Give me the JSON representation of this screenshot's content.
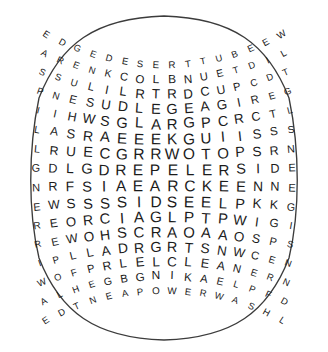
{
  "puzzle": {
    "kind": "word-search-grid",
    "shape": "barrel-distorted-rounded-square",
    "rows": 16,
    "cols": 16,
    "ink_color": "#1b1b1b",
    "background_color": "#ffffff",
    "border_color": "#3c3c3c",
    "grid": [
      [
        "E",
        "D",
        "G",
        "E",
        "D",
        "E",
        "S",
        "E",
        "R",
        "T",
        "T",
        "U",
        "B",
        "E",
        "E",
        "W"
      ],
      [
        "A",
        "R",
        "E",
        "N",
        "K",
        "C",
        "O",
        "L",
        "B",
        "N",
        "U",
        "E",
        "T",
        "D",
        "I",
        "L"
      ],
      [
        "S",
        "S",
        "U",
        "L",
        "I",
        "L",
        "R",
        "T",
        "R",
        "D",
        "C",
        "U",
        "P",
        "C",
        "D",
        "T"
      ],
      [
        "P",
        "N",
        "E",
        "S",
        "U",
        "D",
        "L",
        "E",
        "G",
        "E",
        "A",
        "G",
        "I",
        "R",
        "E",
        "G"
      ],
      [
        "I",
        "I",
        "H",
        "W",
        "S",
        "G",
        "L",
        "A",
        "R",
        "G",
        "P",
        "C",
        "R",
        "C",
        "T",
        "L"
      ],
      [
        "L",
        "A",
        "S",
        "R",
        "A",
        "E",
        "E",
        "E",
        "K",
        "G",
        "U",
        "I",
        "I",
        "S",
        "S",
        "S"
      ],
      [
        "L",
        "R",
        "U",
        "E",
        "C",
        "G",
        "R",
        "R",
        "W",
        "O",
        "T",
        "O",
        "P",
        "S",
        "R",
        "N"
      ],
      [
        "G",
        "D",
        "L",
        "G",
        "D",
        "R",
        "E",
        "P",
        "E",
        "L",
        "E",
        "R",
        "S",
        "I",
        "D",
        "E"
      ],
      [
        "N",
        "R",
        "F",
        "S",
        "I",
        "A",
        "E",
        "A",
        "R",
        "C",
        "K",
        "E",
        "E",
        "N",
        "N",
        "E"
      ],
      [
        "E",
        "W",
        "S",
        "S",
        "S",
        "S",
        "I",
        "D",
        "S",
        "E",
        "E",
        "L",
        "P",
        "K",
        "K",
        "G"
      ],
      [
        "R",
        "E",
        "O",
        "R",
        "C",
        "I",
        "A",
        "G",
        "L",
        "P",
        "T",
        "P",
        "W",
        "I",
        "G",
        "I"
      ],
      [
        "R",
        "E",
        "W",
        "O",
        "H",
        "S",
        "C",
        "R",
        "A",
        "O",
        "A",
        "A",
        "O",
        "S",
        "P",
        "S"
      ],
      [
        "I",
        "P",
        "L",
        "L",
        "A",
        "D",
        "R",
        "G",
        "R",
        "T",
        "S",
        "N",
        "W",
        "C",
        "E",
        "N"
      ],
      [
        "W",
        "O",
        "F",
        "P",
        "R",
        "L",
        "E",
        "L",
        "C",
        "L",
        "E",
        "A",
        "N",
        "E",
        "R",
        "N"
      ],
      [
        "A",
        "L",
        "H",
        "E",
        "G",
        "B",
        "G",
        "N",
        "I",
        "K",
        "A",
        "E",
        "L",
        "P",
        "F",
        "D"
      ],
      [
        "E",
        "D",
        "T",
        "N",
        "E",
        "A",
        "P",
        "O",
        "W",
        "E",
        "R",
        "W",
        "A",
        "S",
        "H",
        "L"
      ]
    ],
    "row_labels": [
      "EDGEDESERTTUBEEW",
      "ARENKCOLBNUETDIL",
      "SSULILRTRDCUPCDT",
      "PNESUDLEGEAGIREG",
      "IIHWSGLARGPCRCTL",
      "LASRAEEEKGUIISSS",
      "LRUECGRRWOTOPSRN",
      "GDLGDREPELERSIDE",
      "NRFSIAEARCKEENNE",
      "EWSSSSIDSEELPKKG",
      "REORCIAGLPTPWIGI",
      "REWOHSCRAOAAOSPS",
      "IPLLADRGRTSNWCEN",
      "WOFPRLELCLEANERN",
      "ALHEGBGNIKAELPFD",
      "EDTNEAPOWERWASHL"
    ]
  }
}
